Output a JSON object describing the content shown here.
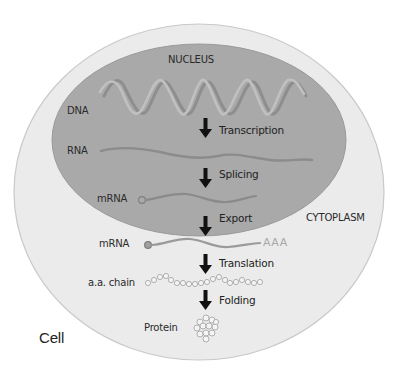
{
  "diagram": {
    "title_regions": {
      "nucleus": "NUCLEUS",
      "cytoplasm": "CYTOPLASM",
      "cell": "Cell"
    },
    "molecules": {
      "dna": "DNA",
      "rna": "RNA",
      "mrna_nuclear": "mRNA",
      "mrna_nuclear_tail": "AAA",
      "mrna_cytoplasmic": "mRNA",
      "mrna_cytoplasmic_tail": "AAA",
      "aa_chain": "a.a. chain",
      "protein": "Protein"
    },
    "steps": [
      {
        "label": "Transcription"
      },
      {
        "label": "Splicing"
      },
      {
        "label": "Export"
      },
      {
        "label": "Translation"
      },
      {
        "label": "Folding"
      }
    ],
    "colors": {
      "background": "#ffffff",
      "cell_fill": "#ebebeb",
      "cell_outline": "#c4c4c4",
      "nucleus_fill": "#a9a9a9",
      "strand": "#8a8a8a",
      "strand_light": "#b8b8b8",
      "arrow": "#111111",
      "poly_a": "#a9a9a9"
    }
  }
}
